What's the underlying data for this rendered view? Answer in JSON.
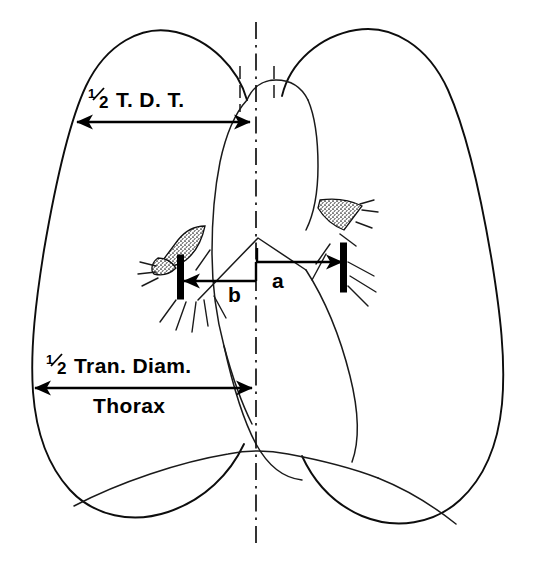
{
  "figure": {
    "kind": "chest-radiograph-measurement-diagram",
    "background_color": "#ffffff",
    "ink_color": "#000000"
  },
  "labels": {
    "tdt": {
      "name": "half-transverse-diameter-thorax-at-hilum",
      "fraction_numerator": "1",
      "fraction_denominator": "2",
      "text": "T. D. T.",
      "full_text": "1/2 T.D.T."
    },
    "thorax": {
      "name": "half-transverse-diameter-thorax",
      "fraction_numerator": "1",
      "fraction_denominator": "2",
      "line1": "Tran. Diam.",
      "line2": "Thorax",
      "full_text": "1/2 Tran. Diam. Thorax"
    },
    "a": {
      "name": "right-cardiac-offset",
      "text": "a"
    },
    "b": {
      "name": "left-cardiac-offset",
      "text": "b"
    }
  },
  "measurements": [
    {
      "id": "tdt",
      "label": "1/2 T.D.T.",
      "x_start": 75,
      "x_end": 252,
      "y": 122,
      "arrow_start": true,
      "arrow_end": true
    },
    {
      "id": "thorax",
      "label": "1/2 Tran. Diam. Thorax",
      "x_start": 33,
      "x_end": 254,
      "y": 388,
      "arrow_start": true,
      "arrow_end": true
    },
    {
      "id": "a",
      "label": "a",
      "x_start": 257,
      "x_end": 344,
      "y": 262,
      "arrow_start": false,
      "arrow_end": true
    },
    {
      "id": "b",
      "label": "b",
      "x_start": 257,
      "x_end": 181,
      "y": 281,
      "arrow_start": false,
      "arrow_end": true
    }
  ],
  "midline": {
    "name": "vertical-midline-axis",
    "x": 256,
    "y_top": 22,
    "y_bottom": 548,
    "style": "dash-dot"
  },
  "tick_bars": [
    {
      "id": "left-cardiac-border-tick",
      "x": 181,
      "y_top": 255,
      "y_bottom": 299
    },
    {
      "id": "right-cardiac-border-tick",
      "x": 344,
      "y_top": 243,
      "y_bottom": 292
    }
  ],
  "anatomy": {
    "left_lung_label": "left-lung-field",
    "right_lung_label": "right-lung-field",
    "heart_label": "cardiac-silhouette",
    "diaphragm_label": "diaphragm-contour",
    "hilum_left_label": "left-hilar-vessel-band",
    "hilum_right_label": "right-hilar-vessel-band",
    "trachea_label": "tracheal-air-column"
  }
}
